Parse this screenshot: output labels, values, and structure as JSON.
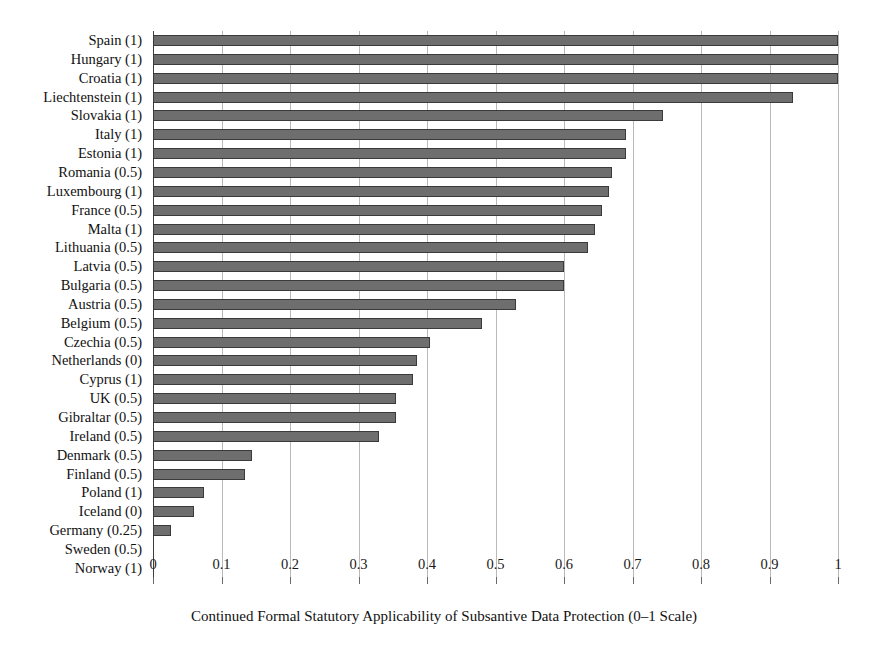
{
  "chart_data": {
    "type": "bar",
    "orientation": "horizontal",
    "title": "",
    "xlabel": "Continued Formal Statutory Applicability of Subsantive Data Protection (0–1 Scale)",
    "ylabel": "",
    "xlim": [
      0,
      1
    ],
    "xticks": [
      "0",
      "0.1",
      "0.2",
      "0.3",
      "0.4",
      "0.5",
      "0.6",
      "0.7",
      "0.8",
      "0.9",
      "1"
    ],
    "xtick_values": [
      0,
      0.1,
      0.2,
      0.3,
      0.4,
      0.5,
      0.6,
      0.7,
      0.8,
      0.9,
      1
    ],
    "grid": "vertical",
    "legend": "none",
    "bar_color": "#6e6e6e",
    "bar_edge_color": "#3a3a3a",
    "gridline_color": "#b9b9b9",
    "axis_color": "#3d3d3d",
    "background": "#ffffff",
    "categories": [
      "Spain (1)",
      "Hungary (1)",
      "Croatia (1)",
      "Liechtenstein (1)",
      "Slovakia (1)",
      "Italy (1)",
      "Estonia (1)",
      "Romania (0.5)",
      "Luxembourg (1)",
      "France (0.5)",
      "Malta (1)",
      "Lithuania (0.5)",
      "Latvia (0.5)",
      "Bulgaria (0.5)",
      "Austria (0.5)",
      "Belgium (0.5)",
      "Czechia (0.5)",
      "Netherlands (0)",
      "Cyprus (1)",
      "UK (0.5)",
      "Gibraltar (0.5)",
      "Ireland (0.5)",
      "Denmark (0.5)",
      "Finland (0.5)",
      "Poland (1)",
      "Iceland (0)",
      "Germany (0.25)",
      "Sweden (0.5)",
      "Norway (1)"
    ],
    "values": [
      1.0,
      1.0,
      1.0,
      0.935,
      0.745,
      0.69,
      0.69,
      0.67,
      0.665,
      0.655,
      0.645,
      0.635,
      0.6,
      0.6,
      0.53,
      0.48,
      0.405,
      0.385,
      0.38,
      0.355,
      0.355,
      0.33,
      0.145,
      0.135,
      0.075,
      0.06,
      0.027,
      0.0,
      0.0
    ]
  }
}
